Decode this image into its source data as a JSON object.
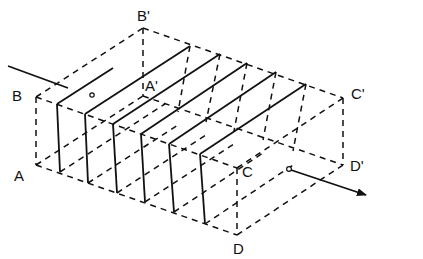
{
  "diagram": {
    "type": "isometric-box-with-planes",
    "vertices": {
      "A": {
        "label": "A",
        "x": 36,
        "y": 165
      },
      "B": {
        "label": "B",
        "x": 36,
        "y": 97
      },
      "C": {
        "label": "C",
        "x": 237,
        "y": 168
      },
      "D": {
        "label": "D",
        "x": 237,
        "y": 235
      },
      "A'": {
        "label": "A'",
        "x": 143,
        "y": 96
      },
      "B'": {
        "label": "B'",
        "x": 143,
        "y": 28
      },
      "C'": {
        "label": "C'",
        "x": 343,
        "y": 98
      },
      "D'": {
        "label": "D'",
        "x": 343,
        "y": 165
      }
    },
    "labels": {
      "A": "A",
      "B": "B",
      "C": "C",
      "D": "D",
      "A_prime": "A'",
      "B_prime": "B'",
      "C_prime": "C'",
      "D_prime": "D'"
    },
    "plane_count": 6,
    "ray": {
      "entry_point": "incoming line from upper left",
      "exit_point": "arrow toward lower right",
      "markers": 2
    },
    "colors": {
      "line": "#111111",
      "background": "#ffffff"
    }
  }
}
